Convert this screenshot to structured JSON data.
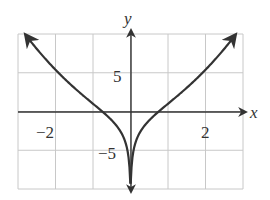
{
  "chart_data": {
    "type": "line",
    "title": "",
    "xlabel": "x",
    "ylabel": "y",
    "xlim": [
      -3,
      3
    ],
    "ylim": [
      -10,
      10
    ],
    "grid": true,
    "x_ticks_labeled": [
      {
        "value": -2,
        "label": "−2"
      },
      {
        "value": 2,
        "label": "2"
      }
    ],
    "y_ticks_labeled": [
      {
        "value": 5,
        "label": "5"
      },
      {
        "value": -5,
        "label": "−5"
      }
    ],
    "grid_x_step": 1,
    "grid_y_step": 5,
    "series": [
      {
        "name": "curve",
        "description": "Even function with vertical asymptote at x=0 (y -> -infinity), crossing x-axis near x = ±0.75, arrows at both ends",
        "x": [
          -2.8,
          -2.5,
          -2,
          -1.5,
          -1,
          -0.75,
          -0.5,
          -0.3,
          -0.15,
          0.15,
          0.3,
          0.5,
          0.75,
          1,
          1.5,
          2,
          2.5,
          2.8
        ],
        "y": [
          9.9,
          8.1,
          5.4,
          3.1,
          1.0,
          0.0,
          -1.1,
          -2.3,
          -3.8,
          -3.8,
          -2.3,
          -1.1,
          0.0,
          1.0,
          3.1,
          5.4,
          8.1,
          9.9
        ]
      }
    ]
  },
  "labels": {
    "x_axis": "x",
    "y_axis": "y",
    "x_neg2": "−2",
    "x_pos2": "2",
    "y_pos5": "5",
    "y_neg5": "−5"
  }
}
